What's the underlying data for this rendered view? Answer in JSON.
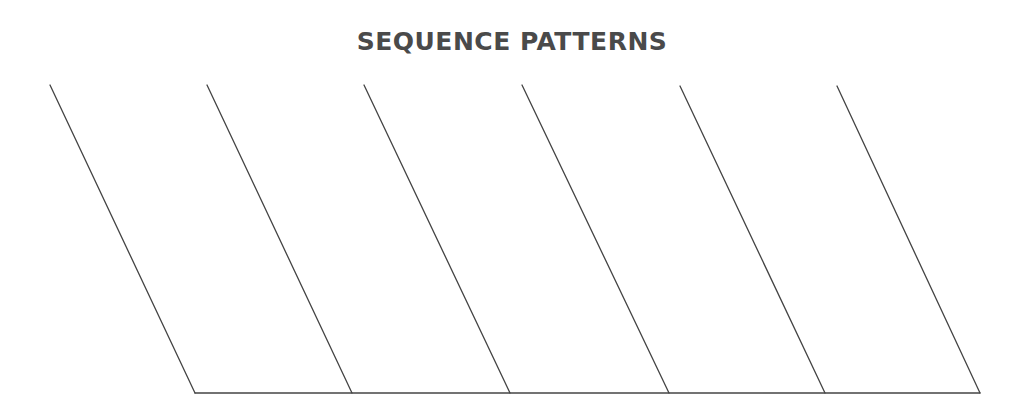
{
  "title": "SEQUENCE PATTERNS",
  "diagram": {
    "stroke_color": "#444444",
    "background": "#ffffff",
    "slanted_lines": [
      {
        "x1": 50,
        "y1": 85,
        "x2": 195,
        "y2": 393
      },
      {
        "x1": 207,
        "y1": 85,
        "x2": 352,
        "y2": 393
      },
      {
        "x1": 364,
        "y1": 85,
        "x2": 510,
        "y2": 393
      },
      {
        "x1": 522,
        "y1": 85,
        "x2": 669,
        "y2": 393
      },
      {
        "x1": 680,
        "y1": 86,
        "x2": 825,
        "y2": 393
      },
      {
        "x1": 837,
        "y1": 86,
        "x2": 980,
        "y2": 393
      }
    ],
    "base_line": {
      "x1": 195,
      "y1": 393,
      "x2": 980,
      "y2": 393
    }
  }
}
